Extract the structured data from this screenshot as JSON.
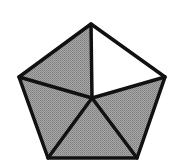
{
  "figure": {
    "total_parts": 5,
    "shaded_parts": 4,
    "unshaded_parts": 1,
    "shaded_fraction": "4/5"
  },
  "colors": {
    "shaded_fill": "#9a9a9a",
    "unshaded_fill": "#ffffff",
    "stroke": "#111111",
    "background": "#ffffff"
  },
  "geometry": {
    "center": [
      92,
      98
    ],
    "vertices": {
      "top": [
        91,
        24
      ],
      "right": [
        165,
        77
      ],
      "bottom_right": [
        137,
        158
      ],
      "bottom_left": [
        48,
        158
      ],
      "left": [
        19,
        77
      ]
    },
    "stroke_width": 3.5
  },
  "regions": [
    {
      "name": "top-left-triangle",
      "shaded": true
    },
    {
      "name": "top-right-triangle",
      "shaded": false
    },
    {
      "name": "right-triangle",
      "shaded": true
    },
    {
      "name": "bottom-triangle",
      "shaded": true
    },
    {
      "name": "left-triangle",
      "shaded": true
    }
  ]
}
